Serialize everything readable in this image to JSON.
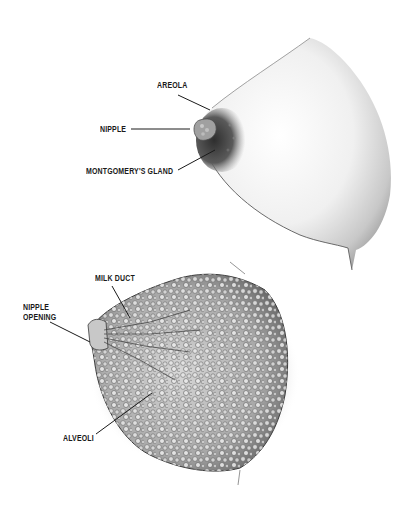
{
  "figure": {
    "upper_illustration": {
      "subject": "external breast view",
      "labels": [
        {
          "id": "areola",
          "text": "AREOLA"
        },
        {
          "id": "nipple",
          "text": "NIPPLE"
        },
        {
          "id": "montgomerys-gland",
          "text": "MONTGOMERY'S GLAND"
        }
      ]
    },
    "lower_illustration": {
      "subject": "internal breast anatomy",
      "labels": [
        {
          "id": "milk-duct",
          "text": "MILK DUCT"
        },
        {
          "id": "nipple-opening",
          "text": "NIPPLE\nOPENING"
        },
        {
          "id": "alveoli",
          "text": "ALVEOLI"
        }
      ]
    },
    "colors": {
      "background": "#ffffff",
      "ink": "#1a1a1a",
      "skin_light": "#f2f2f2",
      "skin_shade": "#9a9a9a",
      "areola": "#4a4a4a",
      "tissue": "#b8b8b8"
    }
  }
}
